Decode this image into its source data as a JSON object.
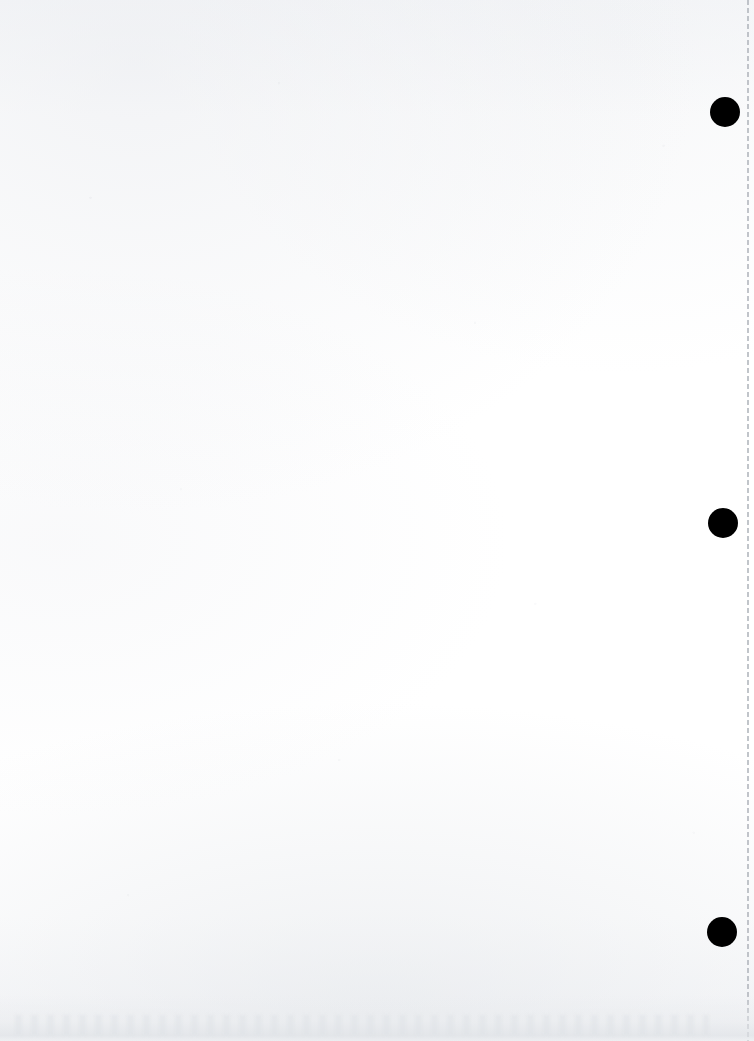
{
  "document": {
    "title": "Scanned blank page",
    "page_width": 754,
    "page_height": 1041,
    "background_color": "#fdfdfd",
    "text_content": "",
    "note": "Blank scanned sheet — no text, headings or figures are present in the pixels."
  },
  "marks": {
    "punch_dot_color": "#000000",
    "punch_dots": [
      {
        "name": "punch-dot-top",
        "cx": 725,
        "cy": 112,
        "diameter": 30
      },
      {
        "name": "punch-dot-middle",
        "cx": 723,
        "cy": 523,
        "diameter": 30
      },
      {
        "name": "punch-dot-bottom",
        "cx": 722,
        "cy": 932,
        "diameter": 30
      }
    ]
  },
  "edge_rule": {
    "name": "right-margin-dashed-rule",
    "x": 747,
    "color": "#b2b6bd",
    "style": "dashed",
    "dash_on": 5,
    "dash_off": 3,
    "width": 2
  },
  "artifacts": {
    "bottom_smudge_color": "#e0e3e7",
    "bottom_smudge_top": 995,
    "paper_tone_color": "#f7f8fa"
  }
}
